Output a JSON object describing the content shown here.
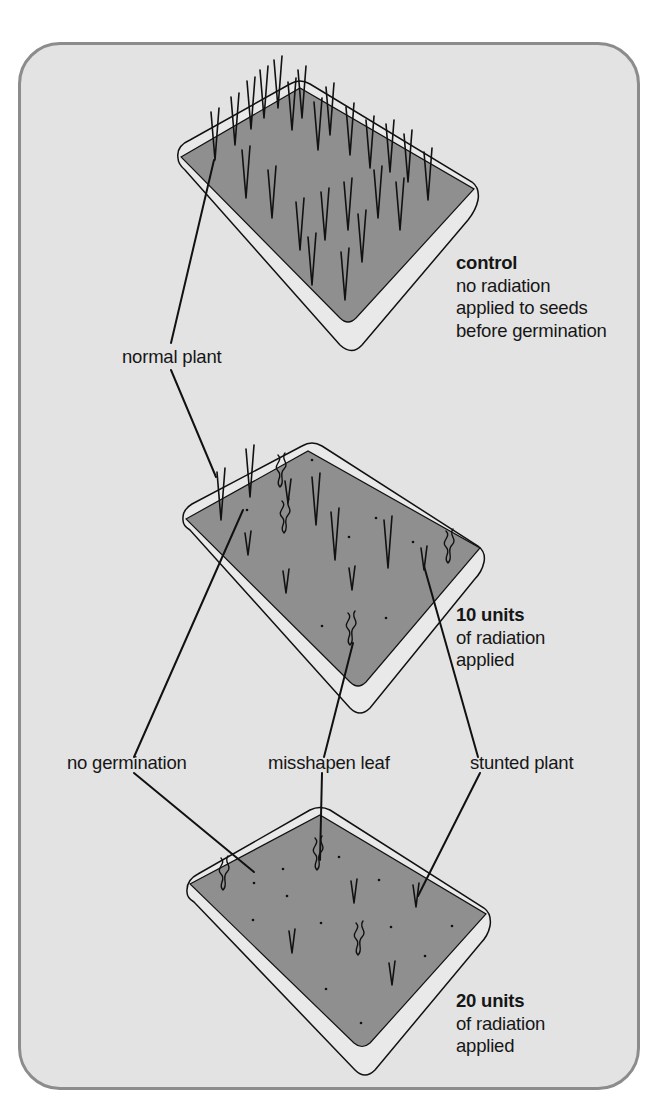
{
  "diagram": {
    "colors": {
      "panel_bg": "#e3e3e3",
      "panel_border": "#8c8c8c",
      "soil": "#8f8f8f",
      "tray_rim": "#e9e9e9",
      "ink": "#111111"
    },
    "trays": [
      {
        "id": "control",
        "title": "control",
        "lines": [
          "no radiation",
          "applied to seeds",
          "before germination"
        ]
      },
      {
        "id": "ten-units",
        "title": "10 units",
        "lines": [
          "of radiation",
          "applied"
        ]
      },
      {
        "id": "twenty-units",
        "title": "20 units",
        "lines": [
          "of radiation",
          "applied"
        ]
      }
    ],
    "callouts": {
      "normal_plant": "normal plant",
      "no_germination": "no germination",
      "misshapen_leaf": "misshapen leaf",
      "stunted_plant": "stunted plant"
    }
  }
}
